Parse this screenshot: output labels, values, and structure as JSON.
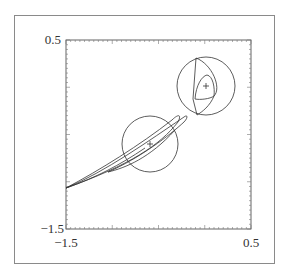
{
  "chart_data": {
    "type": "line",
    "title": "",
    "xlabel": "",
    "ylabel": "",
    "xlim": [
      -1.5,
      0.5
    ],
    "ylim": [
      -1.5,
      0.5
    ],
    "grid": false,
    "legend": null,
    "tick_labels": {
      "x": [
        "-1.5",
        "0.5"
      ],
      "y": [
        "0.5",
        "-1.5"
      ]
    },
    "x_major_ticks": [
      -1.5,
      -1.0,
      -0.5,
      0.0,
      0.5
    ],
    "y_major_ticks": [
      -1.5,
      -1.0,
      -0.5,
      0.0,
      0.5
    ],
    "circles": [
      {
        "name": "circle-1",
        "center": [
          -0.6,
          -0.6
        ],
        "radius": 0.3
      },
      {
        "name": "circle-2",
        "center": [
          0.0,
          0.0
        ],
        "radius": 0.31
      }
    ],
    "centers": [
      {
        "name": "center-mark-1",
        "x": -0.6,
        "y": -0.6,
        "marker": "+"
      },
      {
        "name": "center-mark-2",
        "x": 0.0,
        "y": 0.0,
        "marker": "+"
      }
    ],
    "curves": [
      {
        "name": "elongated-loop-outer",
        "description": "thin elongated loops from (-1.5,-1.1) toward (-0.3,-0.35)"
      },
      {
        "name": "elongated-loop-inner",
        "description": "second loop tip near (-0.35,-0.4)"
      },
      {
        "name": "lens-region",
        "description": "lens bounded by chord x≈-0.12 and arc inside circle-2"
      },
      {
        "name": "inner-teardrop",
        "description": "teardrop shaped contour around (0.0,0.0)"
      }
    ]
  },
  "axes": {
    "x_min_label": "−1.5",
    "x_max_label": "0.5",
    "y_max_label": "0.5",
    "y_min_label": "−1.5"
  }
}
